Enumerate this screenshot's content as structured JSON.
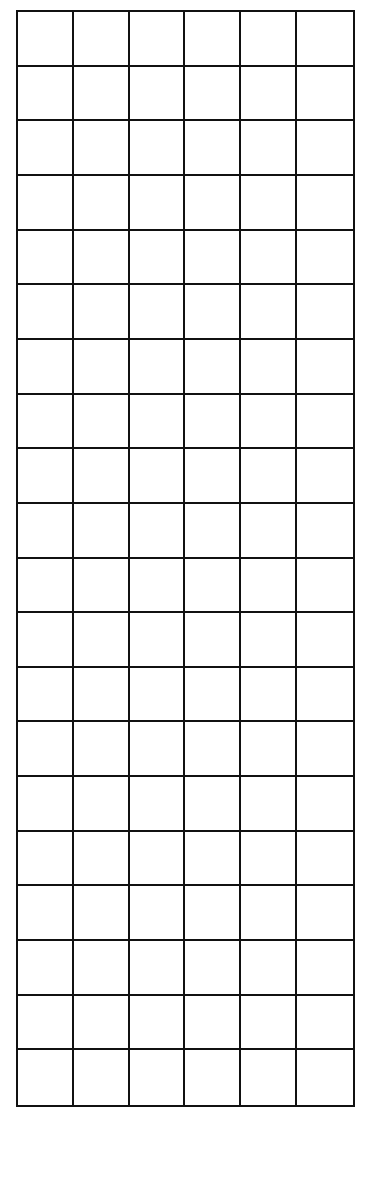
{
  "grid": {
    "rows": 20,
    "columns": 6,
    "line_color": "#111111",
    "background_color": "#ffffff",
    "cells_filled": false
  }
}
